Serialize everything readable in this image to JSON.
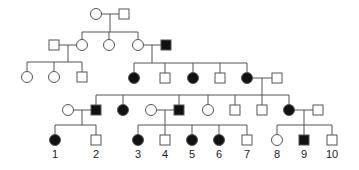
{
  "diagram": {
    "type": "pedigree",
    "colors": {
      "line": "#555555",
      "affected": "#111111",
      "unaffected": "#ffffff"
    },
    "symbol_size": 10,
    "individuals": [
      {
        "id": "I-1",
        "shape": "circle",
        "affected": false,
        "x": 96,
        "y": 14
      },
      {
        "id": "I-2",
        "shape": "square",
        "affected": false,
        "x": 124,
        "y": 14
      },
      {
        "id": "II-1",
        "shape": "square",
        "affected": false,
        "x": 54,
        "y": 45
      },
      {
        "id": "II-2",
        "shape": "circle",
        "affected": false,
        "x": 82,
        "y": 45
      },
      {
        "id": "II-3",
        "shape": "circle",
        "affected": false,
        "x": 109,
        "y": 45
      },
      {
        "id": "II-4",
        "shape": "circle",
        "affected": false,
        "x": 138,
        "y": 45
      },
      {
        "id": "II-5",
        "shape": "square",
        "affected": true,
        "x": 166,
        "y": 45
      },
      {
        "id": "III-1",
        "shape": "circle",
        "affected": false,
        "x": 27,
        "y": 77
      },
      {
        "id": "III-2",
        "shape": "circle",
        "affected": false,
        "x": 54,
        "y": 77
      },
      {
        "id": "III-3",
        "shape": "square",
        "affected": false,
        "x": 82,
        "y": 77
      },
      {
        "id": "III-4",
        "shape": "circle",
        "affected": true,
        "x": 134,
        "y": 78
      },
      {
        "id": "III-5",
        "shape": "square",
        "affected": false,
        "x": 165,
        "y": 78
      },
      {
        "id": "III-6",
        "shape": "circle",
        "affected": true,
        "x": 193,
        "y": 78
      },
      {
        "id": "III-7",
        "shape": "square",
        "affected": false,
        "x": 220,
        "y": 78
      },
      {
        "id": "III-8",
        "shape": "circle",
        "affected": true,
        "x": 247,
        "y": 78
      },
      {
        "id": "III-9",
        "shape": "square",
        "affected": false,
        "x": 277,
        "y": 78
      },
      {
        "id": "IV-0",
        "shape": "circle",
        "affected": false,
        "x": 68,
        "y": 110
      },
      {
        "id": "IV-1",
        "shape": "square",
        "affected": true,
        "x": 96,
        "y": 110
      },
      {
        "id": "IV-2",
        "shape": "circle",
        "affected": true,
        "x": 123,
        "y": 110
      },
      {
        "id": "IV-3",
        "shape": "circle",
        "affected": false,
        "x": 151,
        "y": 110
      },
      {
        "id": "IV-4",
        "shape": "square",
        "affected": true,
        "x": 179,
        "y": 110
      },
      {
        "id": "IV-5",
        "shape": "circle",
        "affected": false,
        "x": 208,
        "y": 110
      },
      {
        "id": "IV-6",
        "shape": "square",
        "affected": false,
        "x": 235,
        "y": 110
      },
      {
        "id": "IV-7",
        "shape": "square",
        "affected": false,
        "x": 262,
        "y": 110
      },
      {
        "id": "IV-8",
        "shape": "circle",
        "affected": true,
        "x": 289,
        "y": 110
      },
      {
        "id": "IV-9",
        "shape": "square",
        "affected": false,
        "x": 318,
        "y": 110
      },
      {
        "id": "V-1",
        "shape": "circle",
        "affected": true,
        "x": 55,
        "y": 140,
        "label": "1"
      },
      {
        "id": "V-2",
        "shape": "square",
        "affected": false,
        "x": 96,
        "y": 140,
        "label": "2"
      },
      {
        "id": "V-3",
        "shape": "circle",
        "affected": true,
        "x": 138,
        "y": 140,
        "label": "3"
      },
      {
        "id": "V-4",
        "shape": "square",
        "affected": false,
        "x": 165,
        "y": 140,
        "label": "4"
      },
      {
        "id": "V-5",
        "shape": "circle",
        "affected": true,
        "x": 192,
        "y": 140,
        "label": "5"
      },
      {
        "id": "V-6",
        "shape": "circle",
        "affected": true,
        "x": 219,
        "y": 140,
        "label": "6"
      },
      {
        "id": "V-7",
        "shape": "square",
        "affected": false,
        "x": 247,
        "y": 140,
        "label": "7"
      },
      {
        "id": "V-8",
        "shape": "circle",
        "affected": false,
        "x": 277,
        "y": 140,
        "label": "8"
      },
      {
        "id": "V-9",
        "shape": "square",
        "affected": true,
        "x": 304,
        "y": 140,
        "label": "9"
      },
      {
        "id": "V-10",
        "shape": "square",
        "affected": false,
        "x": 332,
        "y": 140,
        "label": "10"
      }
    ],
    "lines": [
      [
        101,
        14,
        119,
        14
      ],
      [
        110,
        14,
        110,
        32
      ],
      [
        82,
        32,
        138,
        32
      ],
      [
        82,
        32,
        82,
        40
      ],
      [
        109,
        32,
        109,
        40
      ],
      [
        138,
        32,
        138,
        40
      ],
      [
        59,
        45,
        77,
        45
      ],
      [
        68,
        45,
        68,
        62
      ],
      [
        27,
        62,
        82,
        62
      ],
      [
        27,
        62,
        27,
        72
      ],
      [
        54,
        62,
        54,
        72
      ],
      [
        82,
        62,
        82,
        72
      ],
      [
        143,
        45,
        161,
        45
      ],
      [
        152,
        45,
        152,
        63
      ],
      [
        134,
        63,
        247,
        63
      ],
      [
        134,
        63,
        134,
        73
      ],
      [
        165,
        63,
        165,
        73
      ],
      [
        193,
        63,
        193,
        73
      ],
      [
        220,
        63,
        220,
        73
      ],
      [
        247,
        63,
        247,
        73
      ],
      [
        252,
        78,
        272,
        78
      ],
      [
        262,
        78,
        262,
        95
      ],
      [
        96,
        95,
        289,
        95
      ],
      [
        96,
        95,
        96,
        105
      ],
      [
        123,
        95,
        123,
        105
      ],
      [
        179,
        95,
        179,
        105
      ],
      [
        208,
        95,
        208,
        105
      ],
      [
        235,
        95,
        235,
        105
      ],
      [
        262,
        95,
        262,
        105
      ],
      [
        289,
        95,
        289,
        105
      ],
      [
        73,
        110,
        91,
        110
      ],
      [
        82,
        110,
        82,
        125
      ],
      [
        55,
        125,
        96,
        125
      ],
      [
        55,
        125,
        55,
        135
      ],
      [
        96,
        125,
        96,
        135
      ],
      [
        156,
        110,
        174,
        110
      ],
      [
        165,
        110,
        165,
        125
      ],
      [
        138,
        125,
        247,
        125
      ],
      [
        138,
        125,
        138,
        135
      ],
      [
        165,
        125,
        165,
        135
      ],
      [
        192,
        125,
        192,
        135
      ],
      [
        219,
        125,
        219,
        135
      ],
      [
        247,
        125,
        247,
        135
      ],
      [
        294,
        110,
        313,
        110
      ],
      [
        304,
        110,
        304,
        125
      ],
      [
        277,
        125,
        332,
        125
      ],
      [
        277,
        125,
        277,
        135
      ],
      [
        304,
        125,
        304,
        135
      ],
      [
        332,
        125,
        332,
        135
      ]
    ],
    "label_offset_y": 18
  }
}
